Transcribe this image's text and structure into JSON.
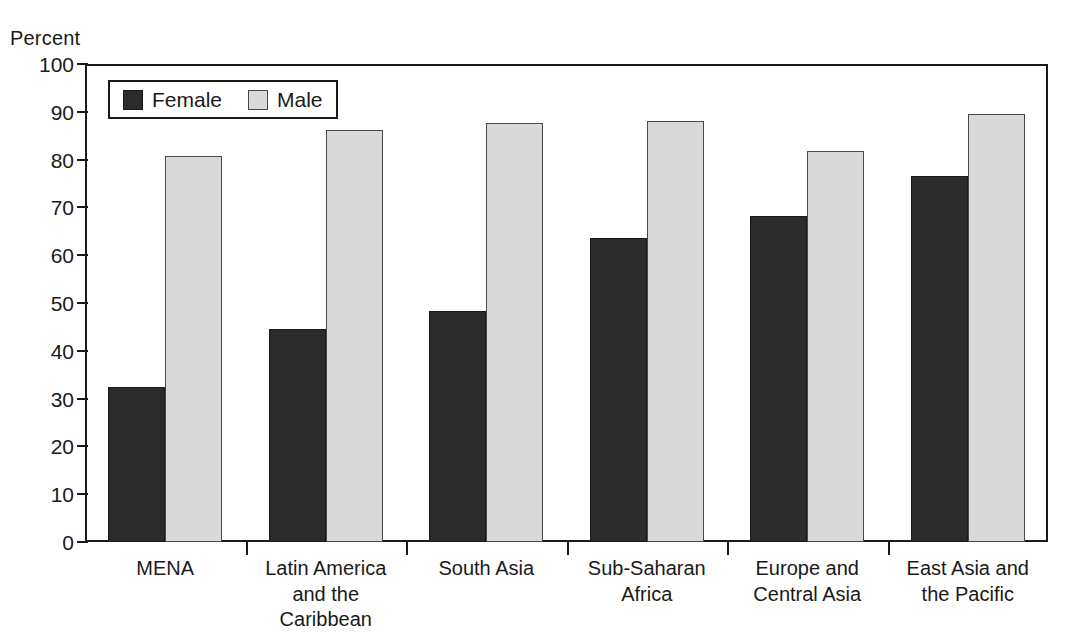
{
  "axis_title": "Percent",
  "legend": {
    "items": [
      {
        "label": "Female",
        "color": "#2b2b2b",
        "swatch_name": "legend-swatch-female"
      },
      {
        "label": "Male",
        "color": "#d9d9d9",
        "swatch_name": "legend-swatch-male"
      }
    ]
  },
  "y_axis": {
    "ticks": [
      "100",
      "90",
      "80",
      "70",
      "60",
      "50",
      "40",
      "30",
      "20",
      "10",
      "0"
    ]
  },
  "x_axis": {
    "labels": [
      "MENA",
      "Latin America\nand the Caribbean",
      "South Asia",
      "Sub-Saharan\nAfrica",
      "Europe and\nCentral Asia",
      "East Asia and\nthe Pacific"
    ]
  },
  "chart_data": {
    "type": "bar",
    "title": "",
    "subtitle": "",
    "xlabel": "",
    "ylabel": "Percent",
    "ylim": [
      0,
      100
    ],
    "ytick_step": 10,
    "grid": false,
    "legend_position": "top-left inside plot",
    "categories": [
      "MENA",
      "Latin America and the Caribbean",
      "South Asia",
      "Sub-Saharan Africa",
      "Europe and Central Asia",
      "East Asia and the Pacific"
    ],
    "series": [
      {
        "name": "Female",
        "color": "#2b2b2b",
        "values": [
          32.5,
          44.5,
          48.3,
          63.5,
          68.3,
          76.5
        ]
      },
      {
        "name": "Male",
        "color": "#d9d9d9",
        "values": [
          80.8,
          86.2,
          87.6,
          88.0,
          81.7,
          89.5
        ]
      }
    ]
  }
}
